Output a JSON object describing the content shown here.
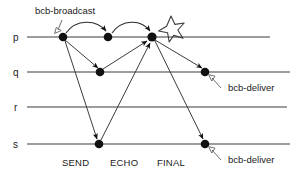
{
  "diagram": {
    "colors": {
      "line": "#3c3c3c",
      "node": "#111111",
      "arrow": "#2b2b2b",
      "pointer": "#6f6f6f",
      "background": "#ffffff"
    },
    "processes": [
      {
        "id": "p",
        "label": "p",
        "y": 37
      },
      {
        "id": "q",
        "label": "q",
        "y": 72
      },
      {
        "id": "r",
        "label": "r",
        "y": 107
      },
      {
        "id": "s",
        "label": "s",
        "y": 144
      }
    ],
    "phases": [
      {
        "label": "SEND",
        "x": 81
      },
      {
        "label": "ECHO",
        "x": 128
      },
      {
        "label": "FINAL",
        "x": 176
      }
    ],
    "annotations": [
      {
        "name": "bcb-broadcast-label",
        "text": "bcb-broadcast",
        "x": 35,
        "y": 14
      },
      {
        "name": "bcb-deliver-label-q",
        "text": "bcb-deliver",
        "x": 228,
        "y": 88
      },
      {
        "name": "bcb-deliver-label-s",
        "text": "bcb-deliver",
        "x": 228,
        "y": 160
      }
    ],
    "events": [
      {
        "name": "node-p-send",
        "process": "p",
        "phase": "SEND",
        "x": 63,
        "y": 37
      },
      {
        "name": "node-p-echo",
        "process": "p",
        "phase": "ECHO",
        "x": 108,
        "y": 37
      },
      {
        "name": "node-p-final",
        "process": "p",
        "phase": "FINAL",
        "x": 152,
        "y": 37
      },
      {
        "name": "node-q-echo",
        "process": "q",
        "phase": "ECHO",
        "x": 100,
        "y": 72
      },
      {
        "name": "node-q-deliver",
        "process": "q",
        "phase": "DELIVER",
        "x": 205,
        "y": 72
      },
      {
        "name": "node-s-send",
        "process": "s",
        "phase": "SEND",
        "x": 99,
        "y": 144
      },
      {
        "name": "node-s-deliver",
        "process": "s",
        "phase": "DELIVER",
        "x": 205,
        "y": 144
      }
    ],
    "star": {
      "name": "burst-star",
      "cx": 171,
      "cy": 28,
      "r": 13
    }
  }
}
